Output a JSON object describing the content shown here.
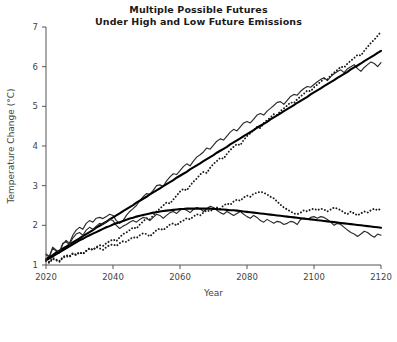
{
  "chart_data": {
    "type": "line",
    "title": "Multiple Possible Futures Under High and Low Future Emissions",
    "title_lines": [
      "Multiple Possible Futures",
      "Under High and Low Future Emissions"
    ],
    "xlabel": "Year",
    "ylabel": "Temperature Change (°C)",
    "xlim": [
      2020,
      2120
    ],
    "ylim": [
      0,
      7
    ],
    "xticks": [
      2020,
      2040,
      2060,
      2080,
      2100,
      2120
    ],
    "xticklabels": [
      "2020",
      "2040",
      "2060",
      "2080",
      "2100",
      "2120"
    ],
    "yticks": [
      1,
      2,
      3,
      4,
      5,
      6,
      7
    ],
    "yticklabels": [
      "1",
      "2",
      "3",
      "4",
      "5",
      "6",
      "7"
    ],
    "grid": false,
    "legend": "none",
    "line_color": "#1a1a1a",
    "trend_color": "#000000",
    "x": [
      2020,
      2021,
      2022,
      2023,
      2024,
      2025,
      2026,
      2027,
      2028,
      2029,
      2030,
      2031,
      2032,
      2033,
      2034,
      2035,
      2036,
      2037,
      2038,
      2039,
      2040,
      2041,
      2042,
      2043,
      2044,
      2045,
      2046,
      2047,
      2048,
      2049,
      2050,
      2051,
      2052,
      2053,
      2054,
      2055,
      2056,
      2057,
      2058,
      2059,
      2060,
      2061,
      2062,
      2063,
      2064,
      2065,
      2066,
      2067,
      2068,
      2069,
      2070,
      2071,
      2072,
      2073,
      2074,
      2075,
      2076,
      2077,
      2078,
      2079,
      2080,
      2081,
      2082,
      2083,
      2084,
      2085,
      2086,
      2087,
      2088,
      2089,
      2090,
      2091,
      2092,
      2093,
      2094,
      2095,
      2096,
      2097,
      2098,
      2099,
      2100,
      2101,
      2102,
      2103,
      2104,
      2105,
      2106,
      2107,
      2108,
      2109,
      2110,
      2111,
      2112,
      2113,
      2114,
      2115,
      2116,
      2117,
      2118,
      2119,
      2120
    ],
    "series": [
      {
        "name": "High emissions - simulation A",
        "style": "jagged",
        "values": [
          1.25,
          1.2,
          1.42,
          1.35,
          1.3,
          1.52,
          1.62,
          1.55,
          1.75,
          1.88,
          1.95,
          1.9,
          2.05,
          2.12,
          2.08,
          2.18,
          2.2,
          2.17,
          2.22,
          2.28,
          2.25,
          2.12,
          2.05,
          2.12,
          2.25,
          2.35,
          2.42,
          2.5,
          2.62,
          2.72,
          2.8,
          2.78,
          2.88,
          3.0,
          3.02,
          2.98,
          3.12,
          3.22,
          3.3,
          3.28,
          3.38,
          3.48,
          3.55,
          3.5,
          3.62,
          3.72,
          3.78,
          3.85,
          3.95,
          3.92,
          4.02,
          4.12,
          4.18,
          4.15,
          4.25,
          4.35,
          4.42,
          4.38,
          4.48,
          4.58,
          4.62,
          4.58,
          4.68,
          4.78,
          4.82,
          4.78,
          4.88,
          4.95,
          5.02,
          5.1,
          5.12,
          5.05,
          5.15,
          5.25,
          5.3,
          5.28,
          5.38,
          5.45,
          5.5,
          5.48,
          5.55,
          5.62,
          5.68,
          5.72,
          5.65,
          5.75,
          5.82,
          5.88,
          5.92,
          5.85,
          5.95,
          6.0,
          6.05,
          5.95,
          5.88,
          5.98,
          6.05,
          6.12,
          6.08,
          6.0,
          6.1
        ]
      },
      {
        "name": "High emissions - simulation B",
        "style": "dotted",
        "values": [
          1.1,
          1.05,
          1.15,
          1.12,
          1.08,
          1.18,
          1.22,
          1.2,
          1.28,
          1.25,
          1.32,
          1.28,
          1.35,
          1.42,
          1.38,
          1.45,
          1.5,
          1.48,
          1.55,
          1.6,
          1.65,
          1.6,
          1.7,
          1.78,
          1.82,
          1.88,
          1.95,
          1.92,
          2.02,
          2.1,
          2.18,
          2.15,
          2.25,
          2.35,
          2.42,
          2.5,
          2.58,
          2.55,
          2.65,
          2.75,
          2.85,
          2.92,
          2.88,
          3.0,
          3.1,
          3.18,
          3.28,
          3.35,
          3.32,
          3.45,
          3.55,
          3.62,
          3.7,
          3.68,
          3.8,
          3.9,
          3.98,
          4.05,
          4.02,
          4.15,
          4.25,
          4.32,
          4.4,
          4.48,
          4.45,
          4.58,
          4.65,
          4.72,
          4.8,
          4.78,
          4.88,
          4.95,
          5.02,
          5.1,
          5.08,
          5.18,
          5.25,
          5.32,
          5.4,
          5.38,
          5.48,
          5.55,
          5.62,
          5.7,
          5.68,
          5.78,
          5.85,
          5.92,
          6.0,
          5.98,
          6.08,
          6.15,
          6.22,
          6.3,
          6.28,
          6.4,
          6.5,
          6.6,
          6.68,
          6.78,
          6.88
        ]
      },
      {
        "name": "High emissions - trend",
        "style": "trend",
        "values": [
          1.15,
          1.2,
          1.25,
          1.31,
          1.36,
          1.41,
          1.46,
          1.52,
          1.57,
          1.62,
          1.67,
          1.73,
          1.78,
          1.83,
          1.88,
          1.94,
          1.99,
          2.04,
          2.09,
          2.15,
          2.2,
          2.25,
          2.3,
          2.36,
          2.41,
          2.46,
          2.51,
          2.57,
          2.62,
          2.67,
          2.72,
          2.78,
          2.83,
          2.88,
          2.93,
          2.99,
          3.04,
          3.09,
          3.14,
          3.2,
          3.25,
          3.3,
          3.35,
          3.41,
          3.46,
          3.51,
          3.56,
          3.62,
          3.67,
          3.72,
          3.77,
          3.83,
          3.88,
          3.93,
          3.98,
          4.04,
          4.09,
          4.14,
          4.19,
          4.25,
          4.3,
          4.35,
          4.4,
          4.46,
          4.51,
          4.56,
          4.61,
          4.67,
          4.72,
          4.77,
          4.82,
          4.88,
          4.93,
          4.98,
          5.03,
          5.09,
          5.14,
          5.19,
          5.24,
          5.3,
          5.35,
          5.4,
          5.45,
          5.51,
          5.56,
          5.61,
          5.66,
          5.72,
          5.77,
          5.82,
          5.87,
          5.93,
          5.98,
          6.03,
          6.08,
          6.14,
          6.19,
          6.24,
          6.29,
          6.35,
          6.4
        ]
      },
      {
        "name": "Low emissions - simulation A",
        "style": "jagged",
        "values": [
          1.28,
          1.22,
          1.45,
          1.38,
          1.32,
          1.55,
          1.58,
          1.52,
          1.68,
          1.78,
          1.82,
          1.75,
          1.88,
          1.95,
          1.9,
          1.98,
          2.05,
          2.02,
          2.1,
          2.15,
          2.12,
          2.0,
          1.92,
          1.98,
          2.02,
          2.08,
          2.12,
          2.08,
          2.15,
          2.2,
          2.18,
          2.12,
          2.2,
          2.28,
          2.25,
          2.18,
          2.25,
          2.32,
          2.35,
          2.3,
          2.38,
          2.42,
          2.38,
          2.32,
          2.4,
          2.45,
          2.42,
          2.35,
          2.42,
          2.48,
          2.45,
          2.38,
          2.32,
          2.28,
          2.35,
          2.3,
          2.25,
          2.3,
          2.35,
          2.28,
          2.22,
          2.18,
          2.25,
          2.2,
          2.12,
          2.08,
          2.15,
          2.1,
          2.05,
          2.1,
          2.08,
          2.02,
          2.05,
          2.1,
          2.08,
          2.02,
          2.15,
          2.18,
          2.15,
          2.2,
          2.22,
          2.18,
          2.22,
          2.2,
          2.15,
          2.08,
          2.0,
          2.05,
          2.02,
          1.95,
          1.88,
          1.82,
          1.78,
          1.72,
          1.78,
          1.85,
          1.82,
          1.75,
          1.7,
          1.78,
          1.75
        ]
      },
      {
        "name": "Low emissions - simulation B",
        "style": "dotted",
        "values": [
          1.12,
          1.08,
          1.18,
          1.14,
          1.1,
          1.2,
          1.25,
          1.22,
          1.3,
          1.26,
          1.32,
          1.28,
          1.36,
          1.42,
          1.38,
          1.45,
          1.42,
          1.38,
          1.45,
          1.5,
          1.52,
          1.48,
          1.55,
          1.6,
          1.58,
          1.65,
          1.7,
          1.68,
          1.75,
          1.8,
          1.78,
          1.72,
          1.8,
          1.88,
          1.92,
          1.88,
          1.95,
          2.02,
          2.05,
          2.0,
          2.08,
          2.12,
          2.18,
          2.15,
          2.22,
          2.28,
          2.25,
          2.32,
          2.38,
          2.35,
          2.42,
          2.45,
          2.42,
          2.5,
          2.55,
          2.52,
          2.6,
          2.65,
          2.62,
          2.7,
          2.75,
          2.72,
          2.8,
          2.82,
          2.85,
          2.82,
          2.78,
          2.72,
          2.68,
          2.6,
          2.52,
          2.45,
          2.4,
          2.35,
          2.3,
          2.28,
          2.32,
          2.38,
          2.35,
          2.4,
          2.42,
          2.38,
          2.42,
          2.4,
          2.35,
          2.4,
          2.45,
          2.42,
          2.38,
          2.32,
          2.28,
          2.35,
          2.3,
          2.25,
          2.3,
          2.35,
          2.32,
          2.38,
          2.42,
          2.38,
          2.42
        ]
      },
      {
        "name": "Low emissions - trend",
        "style": "trend",
        "values": [
          1.12,
          1.17,
          1.22,
          1.27,
          1.32,
          1.37,
          1.42,
          1.47,
          1.52,
          1.57,
          1.62,
          1.66,
          1.71,
          1.75,
          1.79,
          1.83,
          1.87,
          1.91,
          1.95,
          1.98,
          2.02,
          2.05,
          2.08,
          2.11,
          2.14,
          2.17,
          2.19,
          2.22,
          2.24,
          2.26,
          2.28,
          2.3,
          2.32,
          2.33,
          2.35,
          2.36,
          2.37,
          2.38,
          2.39,
          2.4,
          2.41,
          2.41,
          2.42,
          2.42,
          2.42,
          2.42,
          2.42,
          2.42,
          2.42,
          2.42,
          2.41,
          2.41,
          2.4,
          2.4,
          2.39,
          2.38,
          2.38,
          2.37,
          2.36,
          2.35,
          2.34,
          2.33,
          2.32,
          2.31,
          2.3,
          2.29,
          2.28,
          2.27,
          2.26,
          2.25,
          2.24,
          2.23,
          2.22,
          2.21,
          2.2,
          2.19,
          2.18,
          2.17,
          2.16,
          2.15,
          2.14,
          2.13,
          2.12,
          2.11,
          2.1,
          2.09,
          2.08,
          2.07,
          2.06,
          2.05,
          2.04,
          2.03,
          2.02,
          2.01,
          2.0,
          1.99,
          1.98,
          1.97,
          1.96,
          1.95,
          1.94
        ]
      }
    ]
  }
}
